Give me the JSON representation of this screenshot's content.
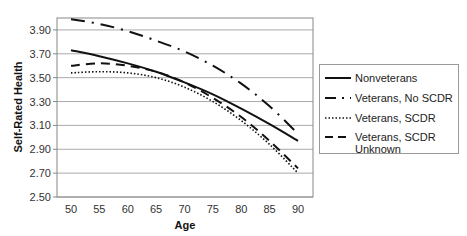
{
  "chart_data": {
    "type": "line",
    "title": "",
    "xlabel": "Age",
    "ylabel": "Self-Rated Health",
    "x": [
      50,
      55,
      60,
      65,
      70,
      75,
      80,
      85,
      90
    ],
    "xticks": [
      "50",
      "55",
      "60",
      "65",
      "70",
      "75",
      "80",
      "85",
      "90"
    ],
    "yticks": [
      "2.50",
      "2.70",
      "2.90",
      "3.10",
      "3.30",
      "3.50",
      "3.70",
      "3.90"
    ],
    "ylim": [
      2.5,
      4.0
    ],
    "grid": "horizontal",
    "legend_position": "right",
    "series": [
      {
        "name": "Nonveterans",
        "style": "solid",
        "values": [
          3.73,
          3.68,
          3.62,
          3.55,
          3.46,
          3.36,
          3.24,
          3.11,
          2.97
        ]
      },
      {
        "name": "Veterans, No SCDR",
        "style": "dash-dot",
        "values": [
          3.99,
          3.95,
          3.89,
          3.81,
          3.72,
          3.6,
          3.45,
          3.26,
          3.03
        ]
      },
      {
        "name": "Veterans, SCDR",
        "style": "dotted",
        "values": [
          3.54,
          3.55,
          3.54,
          3.5,
          3.42,
          3.3,
          3.14,
          2.94,
          2.7
        ]
      },
      {
        "name": "Veterans, SCDR Unknown",
        "style": "dashed",
        "values": [
          3.6,
          3.62,
          3.6,
          3.55,
          3.46,
          3.33,
          3.17,
          2.97,
          2.74
        ]
      }
    ]
  },
  "legend": {
    "items": [
      {
        "label": "Nonveterans"
      },
      {
        "label": "Veterans, No SCDR"
      },
      {
        "label": "Veterans, SCDR"
      },
      {
        "label_line1": "Veterans, SCDR",
        "label_line2": "Unknown"
      }
    ]
  }
}
